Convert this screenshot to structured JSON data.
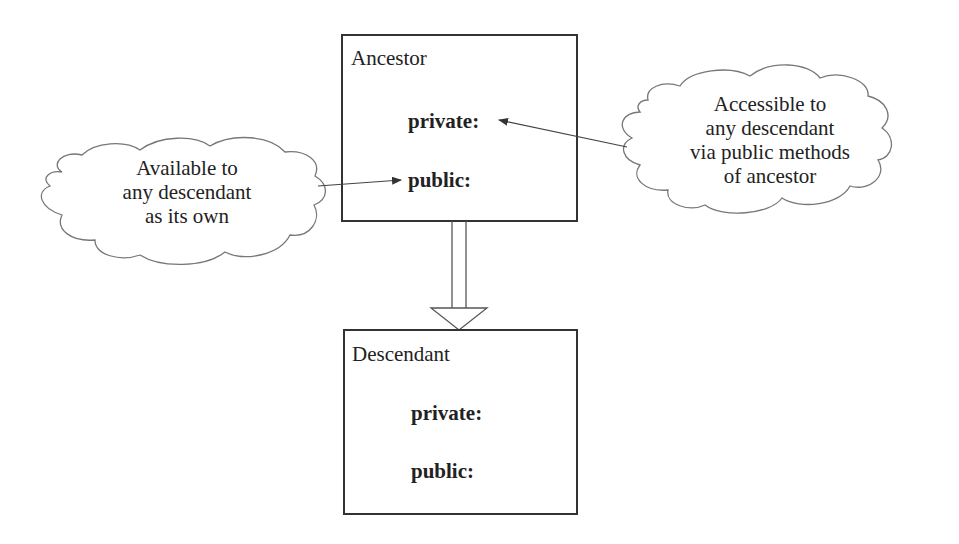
{
  "ancestor": {
    "title": "Ancestor",
    "private_label": "private:",
    "public_label": "public:"
  },
  "descendant": {
    "title": "Descendant",
    "private_label": "private:",
    "public_label": "public:"
  },
  "left_note": {
    "lines": [
      "Available to",
      "any descendant",
      "as its own"
    ]
  },
  "right_note": {
    "lines": [
      "Accessible to",
      "any descendant",
      "via public methods",
      "of ancestor"
    ]
  },
  "relationship": {
    "type": "inheritance",
    "from": "Descendant",
    "to": "Ancestor"
  },
  "colors": {
    "box_border": "#333333",
    "cloud_border": "#777777",
    "arrow": "#444444",
    "text": "#222222"
  }
}
